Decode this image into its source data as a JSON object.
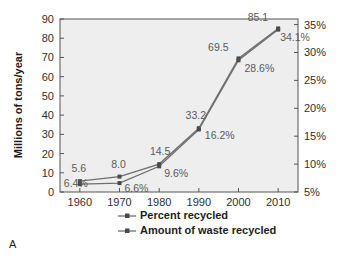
{
  "panel_label": "A",
  "chart_data": {
    "type": "line",
    "title": "",
    "xlabel": "",
    "ylabel": "Millions of tons/year",
    "y2label": "",
    "grid": false,
    "legend_position": "bottom",
    "x": [
      1960,
      1970,
      1980,
      1990,
      2000,
      2010
    ],
    "xtick_labels": [
      "1960",
      "1970",
      "1980",
      "1990",
      "2000",
      "2010"
    ],
    "xlim": [
      1955,
      2015
    ],
    "ylim": [
      0,
      90
    ],
    "ytick_labels": [
      "0",
      "10",
      "20",
      "30",
      "40",
      "50",
      "60",
      "70",
      "80",
      "90"
    ],
    "ytick_values": [
      0,
      10,
      20,
      30,
      40,
      50,
      60,
      70,
      80,
      90
    ],
    "y2lim": [
      5,
      36
    ],
    "y2tick_labels": [
      "5%",
      "10%",
      "15%",
      "20%",
      "25%",
      "30%",
      "35%"
    ],
    "y2tick_values": [
      5,
      10,
      15,
      20,
      25,
      30,
      35
    ],
    "series": [
      {
        "name": "Amount of waste recycled",
        "axis": "left",
        "color": "#6e6e6e",
        "values": [
          5.6,
          8.0,
          14.5,
          33.2,
          69.5,
          85.1
        ],
        "point_labels": [
          "5.6",
          "8.0",
          "14.5",
          "33.2",
          "69.5",
          "85.1"
        ]
      },
      {
        "name": "Percent recycled",
        "axis": "right",
        "color": "#6e6e6e",
        "values": [
          6.4,
          6.6,
          9.6,
          16.2,
          28.6,
          34.1
        ],
        "point_labels": [
          "6.4%",
          "6.6%",
          "9.6%",
          "16.2%",
          "28.6%",
          "34.1%"
        ]
      }
    ],
    "legend": [
      {
        "label": "Percent recycled",
        "color": "#6e6e6e"
      },
      {
        "label": "Amount of waste recycled",
        "color": "#6e6e6e"
      }
    ],
    "plot_background": "#eeeeee",
    "axis_color": "#555555"
  }
}
